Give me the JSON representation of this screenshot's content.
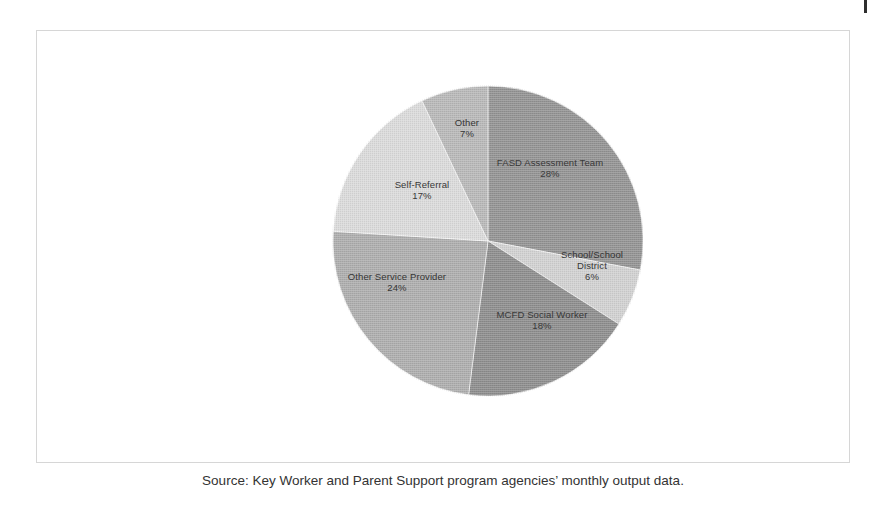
{
  "figure": {
    "caption": "Source: Key Worker and Parent Support program agencies’ monthly output data."
  },
  "chart_data": {
    "type": "pie",
    "title": "",
    "subtitle": "",
    "xlabel": "",
    "ylabel": "",
    "legend": "none",
    "grid": false,
    "units": "percent",
    "start_angle_deg": 0,
    "direction": "clockwise",
    "categories": [
      "FASD Assessment Team",
      "School/School District",
      "MCFD Social Worker",
      "Other Service Provider",
      "Self-Referral",
      "Other"
    ],
    "values": [
      28,
      6,
      18,
      24,
      17,
      7
    ],
    "labels": [
      "FASD Assessment Team",
      "School/School District",
      "MCFD Social Worker",
      "Other Service Provider",
      "Self-Referral",
      "Other"
    ],
    "value_labels": [
      "28%",
      "6%",
      "18%",
      "24%",
      "17%",
      "7%"
    ],
    "colors": [
      "#949494",
      "#d2d2d2",
      "#8e8e8e",
      "#aeaeae",
      "#dcdcdc",
      "#b9b9b9"
    ],
    "slices": [
      {
        "name": "FASD Assessment Team",
        "label": "FASD Assessment Team",
        "percent_label": "28%",
        "value": 28,
        "color": "#949494",
        "start_angle_deg": 0,
        "end_angle_deg": 100.8
      },
      {
        "name": "School/School District",
        "label_line1": "School/School",
        "label_line2": "District",
        "label": "School/School District",
        "percent_label": "6%",
        "value": 6,
        "color": "#d2d2d2",
        "start_angle_deg": 100.8,
        "end_angle_deg": 122.4
      },
      {
        "name": "MCFD Social Worker",
        "label": "MCFD Social Worker",
        "percent_label": "18%",
        "value": 18,
        "color": "#8e8e8e",
        "start_angle_deg": 122.4,
        "end_angle_deg": 187.2
      },
      {
        "name": "Other Service Provider",
        "label": "Other Service Provider",
        "percent_label": "24%",
        "value": 24,
        "color": "#aeaeae",
        "start_angle_deg": 187.2,
        "end_angle_deg": 273.6
      },
      {
        "name": "Self-Referral",
        "label": "Self-Referral",
        "percent_label": "17%",
        "value": 17,
        "color": "#dcdcdc",
        "start_angle_deg": 273.6,
        "end_angle_deg": 334.8
      },
      {
        "name": "Other",
        "label": "Other",
        "percent_label": "7%",
        "value": 7,
        "color": "#b9b9b9",
        "start_angle_deg": 334.8,
        "end_angle_deg": 360
      }
    ]
  }
}
